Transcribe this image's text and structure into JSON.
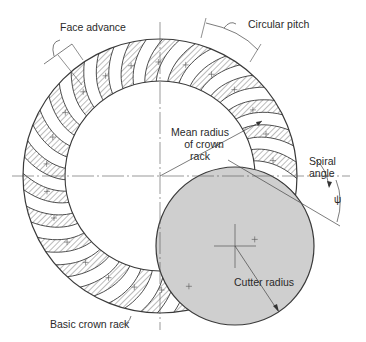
{
  "diagram": {
    "type": "spiral bevel gear crown rack with face-mill cutter",
    "colors": {
      "line": "#3a3a3a",
      "hatch": "#555555",
      "cutter_fill": "#cfcfcf",
      "background": "#ffffff"
    },
    "labels": {
      "face_advance": "Face advance",
      "circular_pitch": "Circular pitch",
      "mean_radius_line1": "Mean radius",
      "mean_radius_line2": "of crown",
      "mean_radius_line3": "rack",
      "spiral_angle_line1": "Spiral",
      "spiral_angle_line2": "angle",
      "psi_symbol": "ψ",
      "cutter_radius": "Cutter radius",
      "basic_crown_rack": "Basic crown rack"
    },
    "geometry": {
      "rack_center": [
        160,
        176
      ],
      "rack_outer_radius": 137,
      "rack_inner_radius": 95,
      "cutter_center": [
        235,
        246
      ],
      "cutter_radius": 79,
      "tooth_count_visible": 14
    }
  }
}
